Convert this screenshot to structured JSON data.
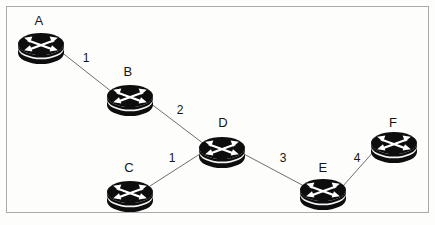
{
  "diagram": {
    "type": "network-topology",
    "title": "",
    "canvas": {
      "width": 435,
      "height": 225
    },
    "frame": {
      "x": 6,
      "y": 6,
      "width": 423,
      "height": 207,
      "border_color": "#a9a9a9",
      "fill": "#fdfdfb"
    },
    "node_icon": "router-icon",
    "node_colors": {
      "body": "#101010",
      "glyph": "#ffffff",
      "outline": "#000000"
    },
    "link_color": "#6e6e6e",
    "nodes": [
      {
        "id": "A",
        "label": "A",
        "x": 41,
        "y": 44,
        "rx": 23,
        "ry": 11,
        "depth": 9,
        "label_x": 39,
        "label_y": 20
      },
      {
        "id": "B",
        "label": "B",
        "x": 130,
        "y": 96,
        "rx": 23,
        "ry": 11,
        "depth": 9,
        "label_x": 128,
        "label_y": 71
      },
      {
        "id": "C",
        "label": "C",
        "x": 130,
        "y": 192,
        "rx": 23,
        "ry": 11,
        "depth": 9,
        "label_x": 129,
        "label_y": 167
      },
      {
        "id": "D",
        "label": "D",
        "x": 222,
        "y": 148,
        "rx": 23,
        "ry": 11,
        "depth": 9,
        "label_x": 223,
        "label_y": 122
      },
      {
        "id": "E",
        "label": "E",
        "x": 323,
        "y": 190,
        "rx": 23,
        "ry": 11,
        "depth": 9,
        "label_x": 323,
        "label_y": 167
      },
      {
        "id": "F",
        "label": "F",
        "x": 394,
        "y": 143,
        "rx": 23,
        "ry": 11,
        "depth": 9,
        "label_x": 393,
        "label_y": 122
      }
    ],
    "links": [
      {
        "id": "A-B",
        "source": "A",
        "target": "B",
        "label": "1",
        "x1": 60,
        "y1": 51,
        "x2": 112,
        "y2": 92,
        "label_x": 86,
        "label_y": 58
      },
      {
        "id": "B-D",
        "source": "B",
        "target": "D",
        "label": "2",
        "x1": 150,
        "y1": 103,
        "x2": 204,
        "y2": 144,
        "label_x": 180,
        "label_y": 110
      },
      {
        "id": "C-D",
        "source": "C",
        "target": "D",
        "label": "1",
        "x1": 150,
        "y1": 186,
        "x2": 203,
        "y2": 152,
        "label_x": 172,
        "label_y": 158
      },
      {
        "id": "D-E",
        "source": "D",
        "target": "E",
        "label": "3",
        "x1": 242,
        "y1": 153,
        "x2": 304,
        "y2": 186,
        "label_x": 283,
        "label_y": 158
      },
      {
        "id": "E-F",
        "source": "E",
        "target": "F",
        "label": "4",
        "x1": 343,
        "y1": 186,
        "x2": 375,
        "y2": 150,
        "label_x": 357,
        "label_y": 158
      }
    ]
  }
}
